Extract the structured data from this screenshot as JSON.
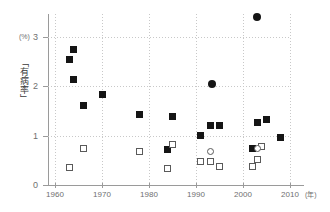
{
  "chart_data": {
    "type": "scatter",
    "title": "",
    "xlabel": "",
    "ylabel": "「有病率」",
    "y_unit": "(%)",
    "x_unit": "(年)",
    "xlim": [
      1958,
      2012
    ],
    "ylim": [
      0,
      3.55
    ],
    "xticks": [
      1960,
      1970,
      1980,
      1990,
      2000,
      2010
    ],
    "xtick_labels": [
      "1960",
      "1970",
      "1980",
      "1990",
      "2000",
      "2010"
    ],
    "yticks": [
      0,
      1,
      2,
      3
    ],
    "ytick_labels": [
      "0",
      "1",
      "2",
      "3"
    ],
    "grid": "dotted-both",
    "legend_position": "none",
    "series": [
      {
        "name": "filled-square",
        "marker": "filled-square",
        "points": [
          {
            "x": 1963,
            "y": 2.54
          },
          {
            "x": 1964,
            "y": 2.75
          },
          {
            "x": 1964,
            "y": 2.14
          },
          {
            "x": 1966,
            "y": 1.62
          },
          {
            "x": 1970,
            "y": 1.83
          },
          {
            "x": 1978,
            "y": 1.42
          },
          {
            "x": 1984,
            "y": 0.72
          },
          {
            "x": 1985,
            "y": 1.38
          },
          {
            "x": 1991,
            "y": 1.01
          },
          {
            "x": 1993,
            "y": 1.2
          },
          {
            "x": 1995,
            "y": 1.2
          },
          {
            "x": 2002,
            "y": 0.74
          },
          {
            "x": 2003,
            "y": 1.26
          },
          {
            "x": 2005,
            "y": 1.33
          },
          {
            "x": 2008,
            "y": 0.96
          }
        ]
      },
      {
        "name": "filled-circle",
        "marker": "filled-circle",
        "points": [
          {
            "x": 1993.5,
            "y": 2.05
          },
          {
            "x": 2003,
            "y": 3.41
          }
        ]
      },
      {
        "name": "open-square",
        "marker": "open-square",
        "points": [
          {
            "x": 1963,
            "y": 0.36
          },
          {
            "x": 1966,
            "y": 0.75
          },
          {
            "x": 1978,
            "y": 0.67
          },
          {
            "x": 1984,
            "y": 0.33
          },
          {
            "x": 1985,
            "y": 0.82
          },
          {
            "x": 1991,
            "y": 0.47
          },
          {
            "x": 1993,
            "y": 0.47
          },
          {
            "x": 1995,
            "y": 0.38
          },
          {
            "x": 2002,
            "y": 0.37
          },
          {
            "x": 2003,
            "y": 0.51
          },
          {
            "x": 2004,
            "y": 0.79
          }
        ]
      },
      {
        "name": "open-circle",
        "marker": "open-circle",
        "points": [
          {
            "x": 1993,
            "y": 0.68
          },
          {
            "x": 2003,
            "y": 0.75
          }
        ]
      }
    ]
  }
}
